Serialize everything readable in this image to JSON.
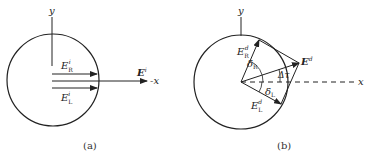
{
  "panels": [
    {
      "id": "a",
      "caption": "(a)",
      "labels": {
        "y_axis": "y",
        "x_axis": "-x",
        "E_R": "E",
        "E_R_sub": "R",
        "E_R_sup": "i",
        "E_L": "E",
        "E_L_sub": "L",
        "E_L_sup": "i",
        "E_total": "E",
        "E_total_sup": "i"
      }
    },
    {
      "id": "b",
      "caption": "(b)",
      "labels": {
        "y_axis": "y",
        "x_axis": "x",
        "E_R": "E",
        "E_R_sub": "R",
        "E_R_sup": "d",
        "E_L": "E",
        "E_L_sub": "L",
        "E_L_sup": "d",
        "E_total": "E",
        "E_total_sup": "d",
        "delta_R": "δ",
        "delta_R_sub": "R",
        "delta_L": "δ",
        "delta_L_sub": "L",
        "delta_tau": "Δτ"
      }
    }
  ],
  "colors": {
    "stroke": "#222222",
    "background": "#ffffff"
  }
}
